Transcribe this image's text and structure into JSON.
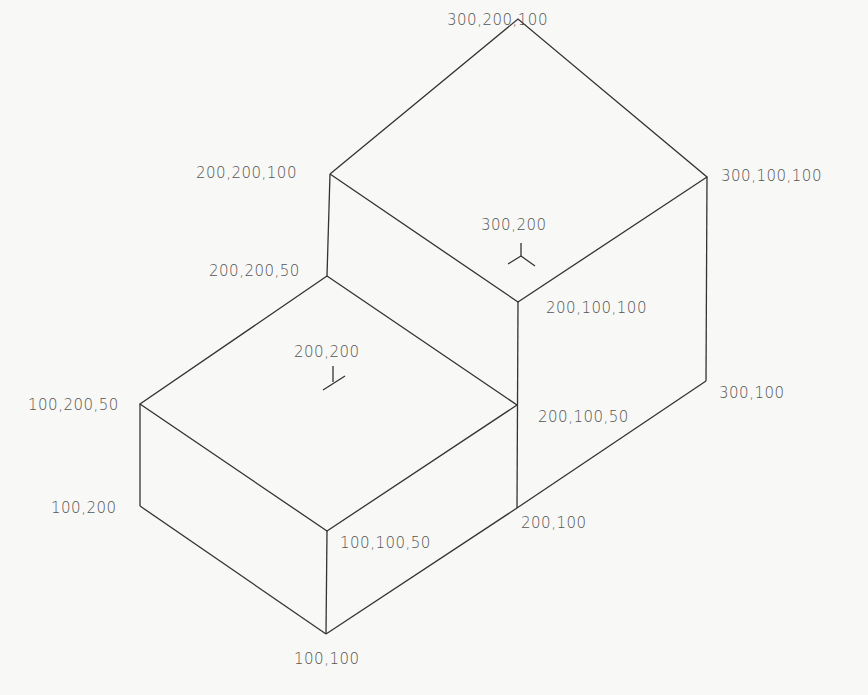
{
  "diagram": {
    "type": "isometric-solid",
    "line_color": "#333333",
    "label_color": "#555555",
    "vertices": [
      {
        "id": "v300_200_100",
        "label": "300,200,100",
        "x": 518,
        "y": 19,
        "lx": 453,
        "ly": 27
      },
      {
        "id": "v200_200_100",
        "label": "200,200,100",
        "x": 330,
        "y": 174,
        "lx": 196,
        "ly": 163
      },
      {
        "id": "v300_100_100",
        "label": "300,100,100",
        "x": 707,
        "y": 177,
        "lx": 720,
        "ly": 167
      },
      {
        "id": "v200_200_50",
        "label": "200,200,50",
        "x": 327,
        "y": 276,
        "lx": 208,
        "ly": 261
      },
      {
        "id": "v200_100_100",
        "label": "200,100,100",
        "x": 518,
        "y": 302,
        "lx": 546,
        "ly": 299
      },
      {
        "id": "v100_200_50",
        "label": "100,200,50",
        "x": 140,
        "y": 404,
        "lx": 27,
        "ly": 396
      },
      {
        "id": "v200_100_50",
        "label": "200,100,50",
        "x": 517,
        "y": 405,
        "lx": 537,
        "ly": 408
      },
      {
        "id": "v300_100",
        "label": "300,100",
        "x": 706,
        "y": 381,
        "lx": 719,
        "ly": 384
      },
      {
        "id": "v100_200",
        "label": "100,200",
        "x": 140,
        "y": 506,
        "lx": 50,
        "ly": 499
      },
      {
        "id": "v200_100",
        "label": "200,100",
        "x": 517,
        "y": 508,
        "lx": 521,
        "ly": 514
      },
      {
        "id": "v100_100_50",
        "label": "100,100,50",
        "x": 327,
        "y": 531,
        "lx": 340,
        "ly": 534
      },
      {
        "id": "v100_100",
        "label": "100,100",
        "x": 326,
        "y": 634,
        "lx": 294,
        "ly": 650
      }
    ],
    "point_markers": [
      {
        "id": "m300_200",
        "label": "300,200",
        "x": 521,
        "y": 256,
        "lx": 481,
        "ly": 216,
        "style": "tripod"
      },
      {
        "id": "m200_200",
        "label": "200,200",
        "x": 328,
        "y": 383,
        "lx": 294,
        "ly": 343,
        "style": "foot"
      }
    ]
  }
}
